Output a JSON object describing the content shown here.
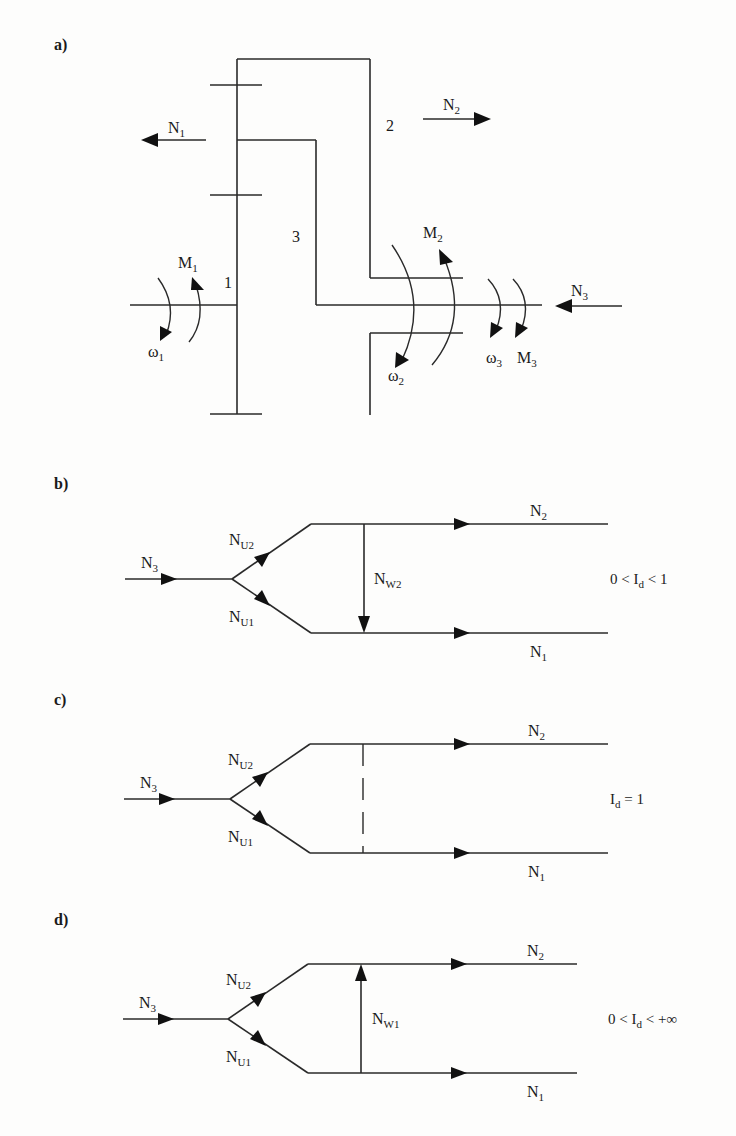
{
  "figure": {
    "background": "#fdfdfc",
    "line_color": "#2a2a2a",
    "panels": {
      "a": {
        "label": "a)",
        "gear_numbers": {
          "g1": "1",
          "g2": "2",
          "g3": "3"
        },
        "forces": {
          "N1": {
            "base": "N",
            "sub": "1",
            "direction": "left"
          },
          "N2": {
            "base": "N",
            "sub": "2",
            "direction": "right"
          },
          "N3": {
            "base": "N",
            "sub": "3",
            "direction": "left"
          }
        },
        "moments": {
          "M1": {
            "base": "M",
            "sub": "1"
          },
          "M2": {
            "base": "M",
            "sub": "2"
          },
          "M3": {
            "base": "M",
            "sub": "3"
          }
        },
        "angular_velocities": {
          "w1": {
            "base": "ω",
            "sub": "1"
          },
          "w2": {
            "base": "ω",
            "sub": "2"
          },
          "w3": {
            "base": "ω",
            "sub": "3"
          }
        }
      },
      "b": {
        "label": "b)",
        "input": {
          "base": "N",
          "sub": "3"
        },
        "upper_branch": {
          "base": "N",
          "sub": "U2"
        },
        "lower_branch": {
          "base": "N",
          "sub": "U1"
        },
        "circulating": {
          "base": "N",
          "sub": "W2",
          "direction": "down"
        },
        "output_top": {
          "base": "N",
          "sub": "2"
        },
        "output_bottom": {
          "base": "N",
          "sub": "1"
        },
        "condition": {
          "pre": "0 < I",
          "sub": "d",
          "post": " < 1"
        }
      },
      "c": {
        "label": "c)",
        "input": {
          "base": "N",
          "sub": "3"
        },
        "upper_branch": {
          "base": "N",
          "sub": "U2"
        },
        "lower_branch": {
          "base": "N",
          "sub": "U1"
        },
        "circulating": {
          "style": "dashed"
        },
        "output_top": {
          "base": "N",
          "sub": "2"
        },
        "output_bottom": {
          "base": "N",
          "sub": "1"
        },
        "condition": {
          "pre": "I",
          "sub": "d",
          "post": " = 1"
        }
      },
      "d": {
        "label": "d)",
        "input": {
          "base": "N",
          "sub": "3"
        },
        "upper_branch": {
          "base": "N",
          "sub": "U2"
        },
        "lower_branch": {
          "base": "N",
          "sub": "U1"
        },
        "circulating": {
          "base": "N",
          "sub": "W1",
          "direction": "up"
        },
        "output_top": {
          "base": "N",
          "sub": "2"
        },
        "output_bottom": {
          "base": "N",
          "sub": "1"
        },
        "condition": {
          "pre": "0 < I",
          "sub": "d",
          "post": " < +∞"
        }
      }
    }
  }
}
